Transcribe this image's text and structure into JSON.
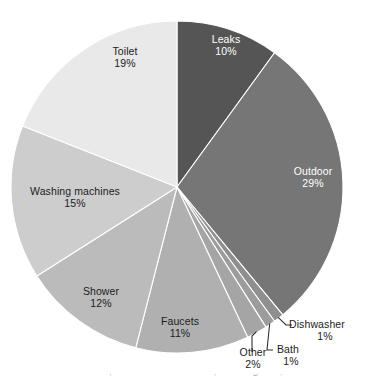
{
  "chart_data": {
    "type": "pie",
    "title": "",
    "subtitle": "",
    "xlabel": "",
    "ylabel": "",
    "legend_position": "none",
    "grid": false,
    "start_angle_deg": 0,
    "direction": "clockwise",
    "unit": "%",
    "categories": [
      "Leaks",
      "Outdoor",
      "Dishwasher",
      "Bath",
      "Other",
      "Faucets",
      "Shower",
      "Washing machines",
      "Toilet"
    ],
    "values": [
      10,
      29,
      1,
      1,
      2,
      11,
      12,
      15,
      19
    ],
    "slices": [
      {
        "name": "Leaks",
        "value": 10,
        "value_label": "10%",
        "color": "#555555",
        "label_placement": "inside",
        "label_color": "#ffffff",
        "label_x": 226,
        "label_y": 40
      },
      {
        "name": "Outdoor",
        "value": 29,
        "value_label": "29%",
        "color": "#767676",
        "label_placement": "inside",
        "label_color": "#ffffff",
        "label_x": 313,
        "label_y": 172
      },
      {
        "name": "Dishwasher",
        "value": 1,
        "value_label": "1%",
        "color": "#8f8f8f",
        "label_placement": "outside",
        "label_color": "#1c1c1c",
        "label_x": 331,
        "label_y": 325
      },
      {
        "name": "Bath",
        "value": 1,
        "value_label": "1%",
        "color": "#9c9c9c",
        "label_placement": "outside",
        "label_color": "#1c1c1c",
        "label_x": 295,
        "label_y": 350
      },
      {
        "name": "Other",
        "value": 2,
        "value_label": "2%",
        "color": "#a5a5a5",
        "label_placement": "outside",
        "label_color": "#1c1c1c",
        "label_x": 253,
        "label_y": 353
      },
      {
        "name": "Faucets",
        "value": 11,
        "value_label": "11%",
        "color": "#b0b0b0",
        "label_placement": "inside",
        "label_color": "#1c1c1c",
        "label_x": 180,
        "label_y": 322
      },
      {
        "name": "Shower",
        "value": 12,
        "value_label": "12%",
        "color": "#bbbbbb",
        "label_placement": "inside",
        "label_color": "#1c1c1c",
        "label_x": 101,
        "label_y": 292
      },
      {
        "name": "Washing machines",
        "value": 15,
        "value_label": "15%",
        "color": "#cdcdcd",
        "label_placement": "inside",
        "label_color": "#1c1c1c",
        "label_x": 75,
        "label_y": 192
      },
      {
        "name": "Toilet",
        "value": 19,
        "value_label": "19%",
        "color": "#e9e9e9",
        "label_placement": "inside",
        "label_color": "#1c1c1c",
        "label_x": 125,
        "label_y": 52
      }
    ],
    "geometry": {
      "center_x": 177,
      "center_y": 187,
      "radius": 166
    }
  },
  "caption": {
    "clipped_text": "Water use at home, U.S. household data, 2016 figures; values rounded"
  },
  "icons": {
    "leader_line": "leader-line-icon"
  }
}
